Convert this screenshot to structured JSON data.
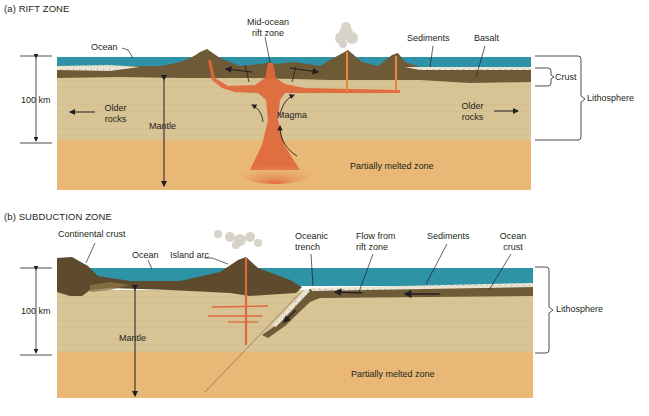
{
  "figure": {
    "colors": {
      "ocean": "#2f93a8",
      "crust": "#6e5a36",
      "lithosphere_mantle": "#d9c496",
      "partially_melted": "#e9b877",
      "magma": "#e0673a",
      "sediments": "#e8e4d6",
      "lines": "#231f20"
    },
    "panel_a": {
      "title": "(a) RIFT ZONE",
      "labels": {
        "ocean": "Ocean",
        "rift_line1": "Mid-ocean",
        "rift_line2": "rift zone",
        "sediments": "Sediments",
        "basalt": "Basalt",
        "crust": "Crust",
        "lithosphere": "Lithosphere",
        "scale": "100 km",
        "older_rocks_left_1": "Older",
        "older_rocks_left_2": "rocks",
        "older_rocks_right_1": "Older",
        "older_rocks_right_2": "rocks",
        "mantle": "Mantle",
        "magma": "Magma",
        "partially_melted": "Partially melted zone"
      }
    },
    "panel_b": {
      "title": "(b) SUBDUCTION ZONE",
      "labels": {
        "continental_crust": "Continental crust",
        "ocean": "Ocean",
        "island_arc": "Island arc",
        "trench_line1": "Oceanic",
        "trench_line2": "trench",
        "flow_line1": "Flow from",
        "flow_line2": "rift zone",
        "sediments": "Sediments",
        "ocean_crust_line1": "Ocean",
        "ocean_crust_line2": "crust",
        "lithosphere": "Lithosphere",
        "scale": "100 km",
        "mantle": "Mantle",
        "partially_melted": "Partially melted zone"
      }
    }
  }
}
